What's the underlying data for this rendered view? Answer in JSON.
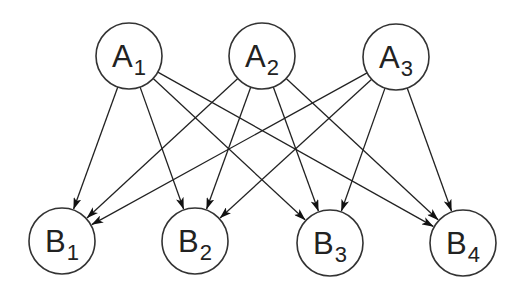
{
  "diagram": {
    "type": "bipartite-directed-graph",
    "colors": {
      "stroke": "#333333",
      "text": "#222222",
      "background": "#ffffff"
    },
    "nodes": [
      {
        "id": "A1",
        "base": "A",
        "sub": "1",
        "x": 129,
        "y": 56
      },
      {
        "id": "A2",
        "base": "A",
        "sub": "2",
        "x": 262,
        "y": 56
      },
      {
        "id": "A3",
        "base": "A",
        "sub": "3",
        "x": 396,
        "y": 57
      },
      {
        "id": "B1",
        "base": "B",
        "sub": "1",
        "x": 62,
        "y": 241
      },
      {
        "id": "B2",
        "base": "B",
        "sub": "2",
        "x": 195,
        "y": 241
      },
      {
        "id": "B3",
        "base": "B",
        "sub": "3",
        "x": 330,
        "y": 243
      },
      {
        "id": "B4",
        "base": "B",
        "sub": "4",
        "x": 463,
        "y": 243
      }
    ],
    "edges": [
      {
        "from": "A1",
        "to": "B1"
      },
      {
        "from": "A1",
        "to": "B2"
      },
      {
        "from": "A1",
        "to": "B3"
      },
      {
        "from": "A1",
        "to": "B4"
      },
      {
        "from": "A2",
        "to": "B1"
      },
      {
        "from": "A2",
        "to": "B2"
      },
      {
        "from": "A2",
        "to": "B3"
      },
      {
        "from": "A2",
        "to": "B4"
      },
      {
        "from": "A3",
        "to": "B1"
      },
      {
        "from": "A3",
        "to": "B2"
      },
      {
        "from": "A3",
        "to": "B3"
      },
      {
        "from": "A3",
        "to": "B4"
      }
    ],
    "radius": 33
  }
}
